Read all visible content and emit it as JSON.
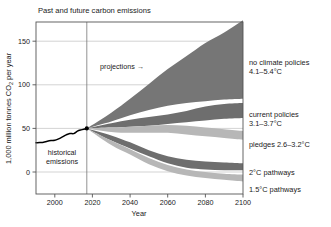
{
  "chart_data": {
    "type": "area",
    "title": "Past and future carbon emissions",
    "xlabel": "Year",
    "ylabel": "1,000 million tonnes CO",
    "ylabel_sub": "2",
    "ylabel_tail": " per year",
    "xlim": [
      1990,
      2100
    ],
    "ylim": [
      -15,
      175
    ],
    "grid": true,
    "legend_position": "right-outside",
    "xticks": [
      2000,
      2020,
      2040,
      2060,
      2080,
      2100
    ],
    "yticks": [
      0,
      50,
      100,
      150
    ],
    "annotations": [
      {
        "name": "projections",
        "text": "projections →",
        "x": 2026,
        "y": 122
      },
      {
        "name": "historical-emissions-line1",
        "text": "historical",
        "x": 2002,
        "y": 28
      },
      {
        "name": "historical-emissions-line2",
        "text": "emissions",
        "x": 2002,
        "y": 19
      }
    ],
    "divider_year": 2017,
    "historical": {
      "name": "historical emissions",
      "color": "#000000",
      "x": [
        1990,
        1992,
        1994,
        1996,
        1998,
        2000,
        2002,
        2004,
        2006,
        2008,
        2010,
        2012,
        2014,
        2016,
        2017
      ],
      "y": [
        33.5,
        33.8,
        34.2,
        35.3,
        36.0,
        36.3,
        38.0,
        40.2,
        42.6,
        44.2,
        44.0,
        46.8,
        48.3,
        49.4,
        50.0
      ]
    },
    "series": [
      {
        "name": "no climate policies",
        "label": "no climate policies",
        "label_detail": "4.1–5.4°C",
        "color": "#767676",
        "x": [
          2017,
          2030,
          2040,
          2050,
          2060,
          2070,
          2080,
          2090,
          2100
        ],
        "upper": [
          50,
          68,
          84,
          101,
          118,
          133,
          148,
          160,
          174
        ],
        "lower": [
          50,
          58,
          65,
          71,
          76,
          79,
          81,
          83,
          84
        ]
      },
      {
        "name": "current policies",
        "label": "current policies",
        "label_detail": "3.1–3.7°C",
        "color": "#6e6e6e",
        "x": [
          2017,
          2030,
          2040,
          2050,
          2060,
          2070,
          2080,
          2090,
          2100
        ],
        "upper": [
          50,
          56,
          60,
          63,
          66,
          70,
          75,
          78,
          79
        ],
        "lower": [
          50,
          51,
          52,
          53,
          55,
          57,
          59,
          61,
          62
        ]
      },
      {
        "name": "pledges",
        "label": "pledges 2.6–3.2°C",
        "label_detail": "",
        "color": "#b7b7b7",
        "x": [
          2017,
          2030,
          2040,
          2050,
          2060,
          2070,
          2080,
          2090,
          2100
        ],
        "upper": [
          50,
          51,
          52,
          53,
          54,
          53,
          51,
          49,
          47
        ],
        "lower": [
          50,
          46,
          45,
          45,
          45,
          43,
          41,
          39,
          37
        ]
      },
      {
        "name": "2C pathways",
        "label": "2°C pathways",
        "label_detail": "",
        "color": "#6e6e6e",
        "x": [
          2017,
          2030,
          2040,
          2050,
          2060,
          2070,
          2080,
          2090,
          2100
        ],
        "upper": [
          50,
          42,
          34,
          25,
          18,
          14,
          12,
          11,
          10
        ],
        "lower": [
          50,
          36,
          27,
          18,
          10,
          5,
          3,
          2,
          2
        ]
      },
      {
        "name": "1.5C pathways",
        "label": "1.5°C pathways",
        "label_detail": "",
        "color": "#b7b7b7",
        "x": [
          2017,
          2030,
          2040,
          2050,
          2060,
          2070,
          2080,
          2090,
          2100
        ],
        "upper": [
          50,
          36,
          26,
          16,
          8,
          3,
          0,
          -2,
          -3
        ],
        "lower": [
          50,
          31,
          20,
          9,
          1,
          -4,
          -7,
          -9,
          -11
        ]
      }
    ],
    "side_labels": [
      {
        "name": "no-climate-policies",
        "line1": "no climate policies",
        "line2": "4.1–5.4°C",
        "y": 65
      },
      {
        "name": "current-policies",
        "line1": "current policies",
        "line2": "3.1–3.7°C",
        "y": 117
      },
      {
        "name": "pledges",
        "line1": "pledges 2.6–3.2°C",
        "line2": "",
        "y": 147
      },
      {
        "name": "two-degree-pathways",
        "line1": "2°C pathways",
        "line2": "",
        "y": 175
      },
      {
        "name": "one-point-five-pathways",
        "line1": "1.5°C pathways",
        "line2": "",
        "y": 193
      }
    ]
  }
}
